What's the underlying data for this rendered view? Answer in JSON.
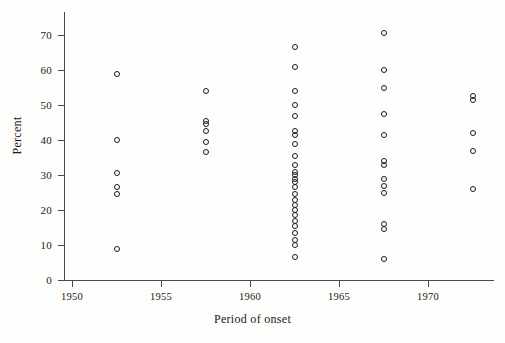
{
  "chart_data": {
    "type": "scatter",
    "title": "",
    "xlabel": "Period of onset",
    "ylabel": "Percent",
    "xlim": [
      1950,
      1974
    ],
    "ylim": [
      0,
      73
    ],
    "grid": false,
    "legend": "none",
    "xticks": [
      1950,
      1955,
      1960,
      1965,
      1970
    ],
    "yticks": [
      0,
      10,
      20,
      30,
      40,
      50,
      60,
      70
    ],
    "xtick_labels": [
      "1950",
      "1955",
      "1960",
      "1965",
      "1970"
    ],
    "ytick_labels": [
      "0",
      "10",
      "20",
      "30",
      "40",
      "50",
      "60",
      "70"
    ],
    "marker": "open-circle",
    "marker_color": "#1c1c1c",
    "series": [
      {
        "name": "Percent by period of onset",
        "points": [
          {
            "x": 1952.5,
            "y": 59
          },
          {
            "x": 1952.5,
            "y": 40
          },
          {
            "x": 1952.5,
            "y": 30.5
          },
          {
            "x": 1952.5,
            "y": 26.5
          },
          {
            "x": 1952.5,
            "y": 24.5
          },
          {
            "x": 1952.5,
            "y": 9
          },
          {
            "x": 1957.5,
            "y": 54
          },
          {
            "x": 1957.5,
            "y": 45.5
          },
          {
            "x": 1957.5,
            "y": 44.5
          },
          {
            "x": 1957.5,
            "y": 42.5
          },
          {
            "x": 1957.5,
            "y": 39.5
          },
          {
            "x": 1957.5,
            "y": 36.5
          },
          {
            "x": 1962.5,
            "y": 66.5
          },
          {
            "x": 1962.5,
            "y": 61
          },
          {
            "x": 1962.5,
            "y": 54
          },
          {
            "x": 1962.5,
            "y": 50
          },
          {
            "x": 1962.5,
            "y": 47
          },
          {
            "x": 1962.5,
            "y": 42.5
          },
          {
            "x": 1962.5,
            "y": 41.5
          },
          {
            "x": 1962.5,
            "y": 39
          },
          {
            "x": 1962.5,
            "y": 35.5
          },
          {
            "x": 1962.5,
            "y": 33
          },
          {
            "x": 1962.5,
            "y": 31
          },
          {
            "x": 1962.5,
            "y": 30
          },
          {
            "x": 1962.5,
            "y": 29
          },
          {
            "x": 1962.5,
            "y": 28
          },
          {
            "x": 1962.5,
            "y": 26.5
          },
          {
            "x": 1962.5,
            "y": 24.5
          },
          {
            "x": 1962.5,
            "y": 23
          },
          {
            "x": 1962.5,
            "y": 21.5
          },
          {
            "x": 1962.5,
            "y": 20
          },
          {
            "x": 1962.5,
            "y": 18.5
          },
          {
            "x": 1962.5,
            "y": 17
          },
          {
            "x": 1962.5,
            "y": 15.5
          },
          {
            "x": 1962.5,
            "y": 13.5
          },
          {
            "x": 1962.5,
            "y": 11.5
          },
          {
            "x": 1962.5,
            "y": 10
          },
          {
            "x": 1962.5,
            "y": 6.5
          },
          {
            "x": 1967.5,
            "y": 70.5
          },
          {
            "x": 1967.5,
            "y": 60
          },
          {
            "x": 1967.5,
            "y": 55
          },
          {
            "x": 1967.5,
            "y": 47.5
          },
          {
            "x": 1967.5,
            "y": 41.5
          },
          {
            "x": 1967.5,
            "y": 34
          },
          {
            "x": 1967.5,
            "y": 33
          },
          {
            "x": 1967.5,
            "y": 29
          },
          {
            "x": 1967.5,
            "y": 27
          },
          {
            "x": 1967.5,
            "y": 25
          },
          {
            "x": 1967.5,
            "y": 16
          },
          {
            "x": 1967.5,
            "y": 14.5
          },
          {
            "x": 1967.5,
            "y": 6
          },
          {
            "x": 1972.5,
            "y": 52.5
          },
          {
            "x": 1972.5,
            "y": 51.5
          },
          {
            "x": 1972.5,
            "y": 42
          },
          {
            "x": 1972.5,
            "y": 37
          },
          {
            "x": 1972.5,
            "y": 26
          }
        ]
      }
    ]
  }
}
